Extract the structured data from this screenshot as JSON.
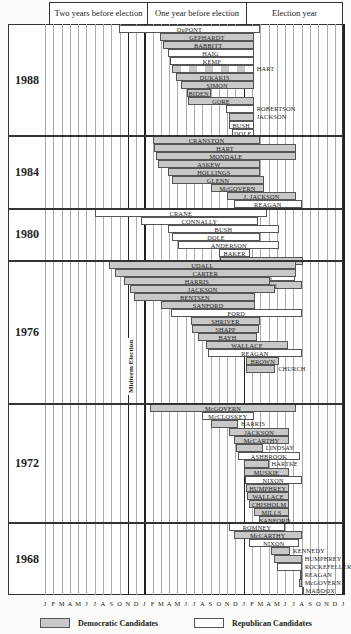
{
  "chart_data": {
    "type": "gantt",
    "title": "",
    "header": [
      "Two years before election",
      "One year before election",
      "Election year"
    ],
    "x_axis": {
      "months_per_year": 12,
      "total_months": 36,
      "tick_labels": [
        "J",
        "F",
        "M",
        "A",
        "M",
        "J",
        "J",
        "A",
        "S",
        "O",
        "N",
        "D",
        "J",
        "F",
        "M",
        "A",
        "M",
        "J",
        "J",
        "A",
        "S",
        "O",
        "N",
        "D",
        "J",
        "F",
        "M",
        "A",
        "M",
        "J",
        "J",
        "A",
        "S",
        "O",
        "N",
        "D",
        "J"
      ]
    },
    "midterm_label": "Midterm Election",
    "legend": [
      {
        "label": "Democratic Candidates",
        "party": "dem",
        "color": "#c8c8c8"
      },
      {
        "label": "Republican Candidates",
        "party": "rep",
        "color": "#ffffff"
      }
    ],
    "sections": [
      {
        "year": "1988",
        "top": 24,
        "bottom": 135,
        "bars": [
          {
            "name": "DuPONT",
            "party": "rep",
            "start": 8.9,
            "end": 26.0,
            "row": 0
          },
          {
            "name": "GEPHARDT",
            "party": "dem",
            "start": 13.9,
            "end": 25.2,
            "row": 1
          },
          {
            "name": "BABBITT",
            "party": "dem",
            "start": 14.2,
            "end": 25.2,
            "row": 2
          },
          {
            "name": "HAIG",
            "party": "rep",
            "start": 14.8,
            "end": 25.2,
            "row": 3
          },
          {
            "name": "KEMP",
            "party": "rep",
            "start": 15.1,
            "end": 25.2,
            "row": 4
          },
          {
            "name": "HART",
            "party": "dem",
            "start": 15.3,
            "end": 25.2,
            "row": 5,
            "label_outside": true,
            "hatched": true
          },
          {
            "name": "DUKAKIS",
            "party": "dem",
            "start": 15.8,
            "end": 25.2,
            "row": 6
          },
          {
            "name": "SIMON",
            "party": "dem",
            "start": 16.4,
            "end": 25.2,
            "row": 7
          },
          {
            "name": "BIDEN",
            "party": "dem",
            "start": 17.1,
            "end": 20.0,
            "row": 8
          },
          {
            "name": "GORE",
            "party": "dem",
            "start": 17.3,
            "end": 25.2,
            "row": 9
          },
          {
            "name": "ROBERTSON",
            "party": "rep",
            "start": 21.8,
            "end": 25.2,
            "row": 10,
            "label_outside": true
          },
          {
            "name": "JACKSON",
            "party": "dem",
            "start": 22.2,
            "end": 25.2,
            "row": 11,
            "label_outside": true
          },
          {
            "name": "BUSH",
            "party": "rep",
            "start": 22.2,
            "end": 25.2,
            "row": 12
          },
          {
            "name": "DOLE",
            "party": "rep",
            "start": 22.6,
            "end": 25.2,
            "row": 13
          }
        ]
      },
      {
        "year": "1984",
        "top": 135,
        "bottom": 208,
        "bars": [
          {
            "name": "CRANSTON",
            "party": "dem",
            "start": 13.0,
            "end": 26.0,
            "row": 0
          },
          {
            "name": "HART",
            "party": "dem",
            "start": 13.2,
            "end": 30.3,
            "row": 1
          },
          {
            "name": "MONDALE",
            "party": "dem",
            "start": 13.4,
            "end": 30.3,
            "row": 2
          },
          {
            "name": "ASKEW",
            "party": "dem",
            "start": 13.6,
            "end": 26.0,
            "row": 3
          },
          {
            "name": "HOLLINGS",
            "party": "dem",
            "start": 14.8,
            "end": 26.0,
            "row": 4
          },
          {
            "name": "GLENN",
            "party": "dem",
            "start": 15.3,
            "end": 26.5,
            "row": 5
          },
          {
            "name": "McGOVERN",
            "party": "dem",
            "start": 20.0,
            "end": 26.5,
            "row": 6
          },
          {
            "name": "J. JACKSON",
            "party": "dem",
            "start": 22.0,
            "end": 30.3,
            "row": 7
          },
          {
            "name": "REAGAN",
            "party": "rep",
            "start": 22.8,
            "end": 31.0,
            "row": 8
          }
        ]
      },
      {
        "year": "1980",
        "top": 208,
        "bottom": 260,
        "bars": [
          {
            "name": "CRANE",
            "party": "rep",
            "start": 6.0,
            "end": 26.8,
            "row": 0
          },
          {
            "name": "CONNALLY",
            "party": "rep",
            "start": 11.6,
            "end": 25.7,
            "row": 1
          },
          {
            "name": "BUSH",
            "party": "rep",
            "start": 14.8,
            "end": 28.3,
            "row": 2
          },
          {
            "name": "DOLE",
            "party": "rep",
            "start": 15.3,
            "end": 26.0,
            "row": 3
          },
          {
            "name": "ANDERSON",
            "party": "rep",
            "start": 16.1,
            "end": 28.3,
            "row": 4
          },
          {
            "name": "BAKER",
            "party": "rep",
            "start": 21.0,
            "end": 24.8,
            "row": 5
          },
          {
            "name": "KENNEDY",
            "party": "dem",
            "start": 21.1,
            "end": 31.1,
            "row": 6
          },
          {
            "name": "BROWN",
            "party": "dem",
            "start": 21.1,
            "end": 25.8,
            "row": 7
          },
          {
            "name": "REAGAN",
            "party": "rep",
            "start": 21.4,
            "end": 30.2,
            "row": 8
          },
          {
            "name": "CARTER",
            "party": "dem",
            "start": 22.0,
            "end": 31.0,
            "row": 9
          }
        ]
      },
      {
        "year": "1976",
        "top": 260,
        "bottom": 403,
        "bars": [
          {
            "name": "UDALL",
            "party": "dem",
            "start": 7.7,
            "end": 30.3,
            "row": 0
          },
          {
            "name": "CARTER",
            "party": "dem",
            "start": 8.4,
            "end": 30.3,
            "row": 1
          },
          {
            "name": "HARRIS",
            "party": "dem",
            "start": 9.5,
            "end": 27.2,
            "row": 2
          },
          {
            "name": "JACKSON",
            "party": "dem",
            "start": 10.3,
            "end": 27.8,
            "row": 3
          },
          {
            "name": "BENTSEN",
            "party": "dem",
            "start": 10.8,
            "end": 25.4,
            "row": 4
          },
          {
            "name": "SANFORD",
            "party": "dem",
            "start": 14.0,
            "end": 25.4,
            "row": 5
          },
          {
            "name": "FORD",
            "party": "rep",
            "start": 15.2,
            "end": 31.0,
            "row": 6
          },
          {
            "name": "SHRIVER",
            "party": "dem",
            "start": 17.6,
            "end": 26.0,
            "row": 7
          },
          {
            "name": "SHAPP",
            "party": "dem",
            "start": 17.8,
            "end": 25.8,
            "row": 8
          },
          {
            "name": "BAYH",
            "party": "dem",
            "start": 18.5,
            "end": 25.6,
            "row": 9
          },
          {
            "name": "WALLACE",
            "party": "dem",
            "start": 19.5,
            "end": 29.3,
            "row": 10
          },
          {
            "name": "REAGAN",
            "party": "rep",
            "start": 19.7,
            "end": 31.0,
            "row": 11
          },
          {
            "name": "BROWN",
            "party": "dem",
            "start": 24.3,
            "end": 28.3,
            "row": 12
          },
          {
            "name": "CHURCH",
            "party": "dem",
            "start": 24.3,
            "end": 27.8,
            "row": 13,
            "label_outside": true
          }
        ]
      },
      {
        "year": "1972",
        "top": 403,
        "bottom": 522,
        "bars": [
          {
            "name": "McGOVERN",
            "party": "dem",
            "start": 12.7,
            "end": 30.3,
            "row": 0
          },
          {
            "name": "McCLOSKEY",
            "party": "rep",
            "start": 19.0,
            "end": 25.2,
            "row": 1
          },
          {
            "name": "HARRIS",
            "party": "dem",
            "start": 20.0,
            "end": 23.3,
            "row": 2,
            "label_outside": true
          },
          {
            "name": "JACKSON",
            "party": "dem",
            "start": 22.2,
            "end": 29.5,
            "row": 3
          },
          {
            "name": "McCARTHY",
            "party": "dem",
            "start": 22.8,
            "end": 29.5,
            "row": 4
          },
          {
            "name": "LINDSAY",
            "party": "dem",
            "start": 23.1,
            "end": 26.3,
            "row": 5,
            "label_outside": true
          },
          {
            "name": "ASHBROOK",
            "party": "rep",
            "start": 23.3,
            "end": 30.8,
            "row": 6
          },
          {
            "name": "HARTKE",
            "party": "dem",
            "start": 24.0,
            "end": 27.0,
            "row": 7,
            "label_outside": true
          },
          {
            "name": "MUSKIE",
            "party": "dem",
            "start": 24.0,
            "end": 29.5,
            "row": 8
          },
          {
            "name": "NIXON",
            "party": "rep",
            "start": 24.1,
            "end": 31.0,
            "row": 9
          },
          {
            "name": "HUMPHREY",
            "party": "dem",
            "start": 24.3,
            "end": 29.5,
            "row": 10
          },
          {
            "name": "WALLACE",
            "party": "dem",
            "start": 24.4,
            "end": 29.5,
            "row": 11
          },
          {
            "name": "CHISHOLM",
            "party": "dem",
            "start": 24.6,
            "end": 29.5,
            "row": 12
          },
          {
            "name": "MILLS",
            "party": "dem",
            "start": 25.2,
            "end": 29.5,
            "row": 13
          },
          {
            "name": "SANFORD",
            "party": "dem",
            "start": 25.8,
            "end": 29.5,
            "row": 14
          }
        ]
      },
      {
        "year": "1968",
        "top": 522,
        "bottom": 595,
        "bars": [
          {
            "name": "ROMNEY",
            "party": "rep",
            "start": 22.2,
            "end": 29.0,
            "row": 0
          },
          {
            "name": "McCARTHY",
            "party": "dem",
            "start": 22.8,
            "end": 31.0,
            "row": 1
          },
          {
            "name": "NIXON",
            "party": "rep",
            "start": 24.6,
            "end": 30.7,
            "row": 2
          },
          {
            "name": "KENNEDY",
            "party": "dem",
            "start": 27.3,
            "end": 29.6,
            "row": 3,
            "label_outside": true
          },
          {
            "name": "HUMPHREY",
            "party": "dem",
            "start": 27.6,
            "end": 31.0,
            "row": 4,
            "label_outside": true
          },
          {
            "name": "ROCKEFELLER",
            "party": "rep",
            "start": 28.0,
            "end": 31.0,
            "row": 5,
            "label_outside": true
          },
          {
            "name": "REAGAN",
            "party": "rep",
            "start": 30.8,
            "end": 31.0,
            "row": 6,
            "label_outside": true
          },
          {
            "name": "McGOVERN",
            "party": "dem",
            "start": 30.7,
            "end": 31.0,
            "row": 7,
            "label_outside": true
          },
          {
            "name": "MADDOX",
            "party": "dem",
            "start": 31.0,
            "end": 31.1,
            "row": 8,
            "label_outside": true
          }
        ]
      }
    ]
  }
}
